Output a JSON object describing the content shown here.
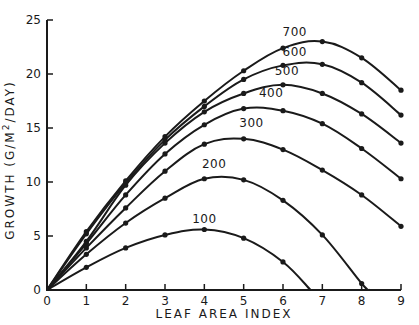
{
  "chart_data": {
    "type": "line",
    "title": "",
    "xlabel": "LEAF AREA INDEX",
    "ylabel": "GROWTH (G/M²/DAY)",
    "ylabel_parts": {
      "main": "GROWTH  (G/M",
      "sup": "2",
      "tail": "/DAY)"
    },
    "xlim": [
      0,
      9
    ],
    "ylim": [
      0,
      25
    ],
    "xticks": [
      0,
      1,
      2,
      3,
      4,
      5,
      6,
      7,
      8,
      9
    ],
    "xtick_labels": [
      "0",
      "1",
      "2",
      "3",
      "4",
      "5",
      "6",
      "7",
      "8",
      "9"
    ],
    "yticks": [
      0,
      5,
      10,
      15,
      20,
      25
    ],
    "ytick_labels": [
      "0",
      "5",
      "10",
      "15",
      "20",
      "25"
    ],
    "grid": false,
    "legend": "inline labels above each curve",
    "series": [
      {
        "name": "100",
        "label_at": [
          4,
          6.2
        ],
        "x": [
          0,
          1,
          2,
          3,
          4,
          5,
          6,
          6.7
        ],
        "y": [
          0,
          2.1,
          3.9,
          5.1,
          5.6,
          4.8,
          2.6,
          0
        ],
        "markers_x": [
          1,
          2,
          3,
          4,
          5,
          6
        ]
      },
      {
        "name": "200",
        "label_at": [
          4.25,
          11.3
        ],
        "x": [
          0,
          1,
          2,
          3,
          4,
          5,
          6,
          7,
          8,
          8.2
        ],
        "y": [
          0,
          3.3,
          6.2,
          8.5,
          10.3,
          10.2,
          8.3,
          5.1,
          0.6,
          0
        ],
        "markers_x": [
          1,
          2,
          3,
          4,
          5,
          6,
          7,
          8
        ]
      },
      {
        "name": "300",
        "label_at": [
          5.2,
          15.1
        ],
        "x": [
          0,
          1,
          2,
          3,
          4,
          5,
          6,
          7,
          8,
          9
        ],
        "y": [
          0,
          3.9,
          7.6,
          11.0,
          13.5,
          14.0,
          13.0,
          11.1,
          8.8,
          5.9
        ],
        "markers_x": [
          1,
          2,
          3,
          4,
          5,
          6,
          7,
          8,
          9
        ]
      },
      {
        "name": "400",
        "label_at": [
          5.7,
          17.9
        ],
        "x": [
          0,
          1,
          2,
          3,
          4,
          5,
          6,
          7,
          8,
          9
        ],
        "y": [
          0,
          4.3,
          8.8,
          12.6,
          15.3,
          16.8,
          16.6,
          15.4,
          13.1,
          10.3
        ],
        "markers_x": [
          1,
          2,
          3,
          4,
          5,
          6,
          7,
          8,
          9
        ]
      },
      {
        "name": "500",
        "label_at": [
          6.1,
          19.9
        ],
        "x": [
          0,
          1,
          2,
          3,
          4,
          5,
          6,
          7,
          8,
          9
        ],
        "y": [
          0,
          4.5,
          9.7,
          13.6,
          16.5,
          18.2,
          19.0,
          18.2,
          16.3,
          13.6
        ],
        "markers_x": [
          1,
          2,
          3,
          4,
          5,
          6,
          7,
          8,
          9
        ]
      },
      {
        "name": "600",
        "label_at": [
          6.3,
          21.7
        ],
        "x": [
          0,
          1,
          2,
          3,
          4,
          5,
          6,
          7,
          8,
          9
        ],
        "y": [
          0,
          5.2,
          9.9,
          13.9,
          17.0,
          19.5,
          20.8,
          20.9,
          19.2,
          16.2
        ],
        "markers_x": [
          1,
          2,
          3,
          4,
          5,
          6,
          7,
          8,
          9
        ]
      },
      {
        "name": "700",
        "label_at": [
          6.3,
          23.5
        ],
        "x": [
          0,
          1,
          2,
          3,
          4,
          5,
          6,
          7,
          8,
          9
        ],
        "y": [
          0,
          5.4,
          10.1,
          14.2,
          17.5,
          20.3,
          22.4,
          23.0,
          21.5,
          18.5
        ],
        "markers_x": [
          1,
          2,
          3,
          4,
          5,
          6,
          7,
          8,
          9
        ]
      }
    ]
  }
}
